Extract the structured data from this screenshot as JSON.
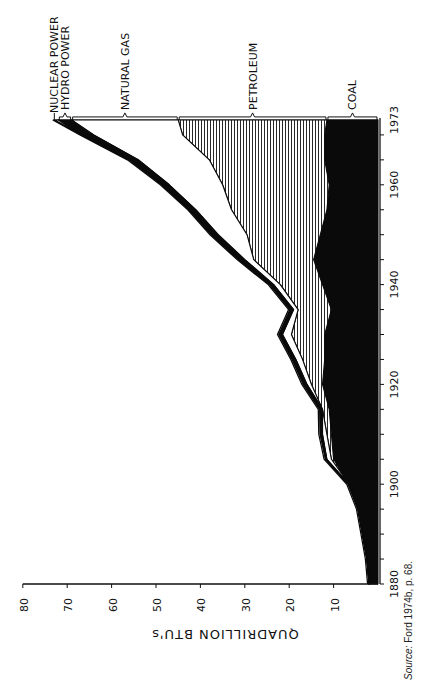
{
  "chart_data": {
    "type": "area",
    "stacked": true,
    "orientation": "rotated-90",
    "title": "",
    "xlabel": "",
    "ylabel": "QUADRILLION BTU's",
    "ylim": [
      0,
      80
    ],
    "yticks": [
      10,
      20,
      30,
      40,
      50,
      60,
      70,
      80
    ],
    "xticks": [
      "1880",
      "1900",
      "1920",
      "1940",
      "1960",
      "1973"
    ],
    "x": [
      1880,
      1885,
      1890,
      1895,
      1900,
      1905,
      1910,
      1915,
      1920,
      1925,
      1930,
      1935,
      1940,
      1945,
      1950,
      1955,
      1960,
      1965,
      1970,
      1973
    ],
    "series": [
      {
        "name": "COAL",
        "fill": "solid-black",
        "values": [
          2.0,
          2.5,
          3.5,
          4.5,
          6.5,
          10.0,
          10.5,
          11.0,
          12.5,
          12.0,
          12.0,
          10.5,
          12.5,
          14.5,
          13.0,
          11.5,
          11.0,
          12.0,
          12.0,
          11.5
        ]
      },
      {
        "name": "PETROLEUM",
        "fill": "vertical-hatch",
        "values": [
          0.0,
          0.0,
          0.0,
          0.0,
          0.0,
          0.5,
          1.0,
          1.5,
          2.5,
          5.0,
          7.5,
          7.5,
          9.5,
          13.5,
          16.5,
          21.5,
          24.0,
          26.0,
          32.0,
          33.5
        ]
      },
      {
        "name": "NATURAL GAS",
        "fill": "white",
        "values": [
          0.0,
          0.0,
          0.0,
          0.0,
          0.0,
          1.0,
          1.0,
          0.0,
          1.0,
          1.5,
          2.0,
          1.0,
          1.5,
          2.0,
          6.5,
          8.0,
          12.0,
          16.0,
          20.0,
          24.0
        ]
      },
      {
        "name": "HYDRO POWER",
        "fill": "black-band",
        "values": [
          0.0,
          0.0,
          0.0,
          0.0,
          0.2,
          0.3,
          0.5,
          0.6,
          0.8,
          0.8,
          0.8,
          0.8,
          0.9,
          1.4,
          1.5,
          1.5,
          1.7,
          2.0,
          2.6,
          3.0
        ]
      },
      {
        "name": "NUCLEAR POWER",
        "fill": "white-band",
        "values": [
          0,
          0,
          0,
          0,
          0,
          0,
          0,
          0,
          0,
          0,
          0,
          0,
          0,
          0,
          0,
          0,
          0.0,
          0.1,
          0.2,
          0.9
        ]
      }
    ],
    "legend_position": "bracket labels at 1973 end",
    "annotations": [
      "NUCLEAR POWER",
      "HYDRO POWER",
      "NATURAL GAS",
      "PETROLEUM",
      "COAL"
    ],
    "source": "Source: Ford 1974b, p. 68."
  },
  "axis": {
    "ylabel": "QUADRILLION BTU's",
    "yticks": [
      "10",
      "20",
      "30",
      "40",
      "50",
      "60",
      "70",
      "80"
    ],
    "xticks": [
      "1880",
      "1900",
      "1920",
      "1940",
      "1960",
      "1973"
    ]
  },
  "labels": {
    "nuclear": "NUCLEAR POWER",
    "hydro": "HYDRO POWER",
    "gas": "NATURAL GAS",
    "petroleum": "PETROLEUM",
    "coal": "COAL"
  },
  "source": {
    "prefix": "Source:",
    "text": "Ford 1974b, p. 68."
  }
}
